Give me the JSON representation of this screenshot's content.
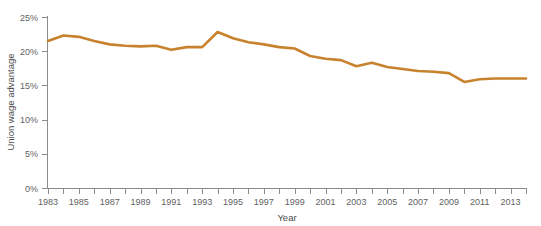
{
  "chart_data": {
    "type": "line",
    "title": "",
    "xlabel": "Year",
    "ylabel": "Union wage advantage",
    "x": [
      1983,
      1984,
      1985,
      1986,
      1987,
      1988,
      1989,
      1990,
      1991,
      1992,
      1993,
      1994,
      1995,
      1996,
      1997,
      1998,
      1999,
      2000,
      2001,
      2002,
      2003,
      2004,
      2005,
      2006,
      2007,
      2008,
      2009,
      2010,
      2011,
      2012,
      2013,
      2014
    ],
    "values": [
      21.5,
      22.3,
      22.1,
      21.5,
      21.0,
      20.8,
      20.7,
      20.8,
      20.2,
      20.6,
      20.6,
      22.8,
      21.9,
      21.3,
      21.0,
      20.6,
      20.4,
      19.3,
      18.9,
      18.7,
      17.8,
      18.3,
      17.7,
      17.4,
      17.1,
      17.0,
      16.8,
      15.5,
      15.9,
      16.0,
      16.0,
      16.0
    ],
    "series": [
      {
        "name": "Union wage advantage",
        "color": "#C8822E",
        "values": [
          21.5,
          22.3,
          22.1,
          21.5,
          21.0,
          20.8,
          20.7,
          20.8,
          20.2,
          20.6,
          20.6,
          22.8,
          21.9,
          21.3,
          21.0,
          20.6,
          20.4,
          19.3,
          18.9,
          18.7,
          17.8,
          18.3,
          17.7,
          17.4,
          17.1,
          17.0,
          16.8,
          15.5,
          15.9,
          16.0,
          16.0,
          16.0
        ]
      }
    ],
    "y_ticks": [
      0,
      5,
      10,
      15,
      20,
      25
    ],
    "y_tick_labels": [
      "0%",
      "5%",
      "10%",
      "15%",
      "20%",
      "25%"
    ],
    "ylim": [
      0,
      25
    ],
    "xlim": [
      1983,
      2014
    ],
    "x_tick_years": [
      1983,
      1984,
      1985,
      1986,
      1987,
      1988,
      1989,
      1990,
      1991,
      1992,
      1993,
      1994,
      1995,
      1996,
      1997,
      1998,
      1999,
      2000,
      2001,
      2002,
      2003,
      2004,
      2005,
      2006,
      2007,
      2008,
      2009,
      2010,
      2011,
      2012,
      2013,
      2014
    ],
    "x_tick_labels": [
      "1983",
      "1985",
      "1987",
      "1989",
      "1991",
      "1993",
      "1995",
      "1997",
      "1999",
      "2001",
      "2003",
      "2005",
      "2007",
      "2009",
      "2011",
      "2013"
    ],
    "x_label_years": [
      1983,
      1985,
      1987,
      1989,
      1991,
      1993,
      1995,
      1997,
      1999,
      2001,
      2003,
      2005,
      2007,
      2009,
      2011,
      2013
    ],
    "grid": false,
    "legend": "none",
    "line_color": "#C8822E",
    "axis_color": "#8c8c8c",
    "text_color": "#5f5f5f",
    "background": "#ffffff"
  },
  "axes": {
    "y_axis_title": "Union wage advantage",
    "x_axis_title": "Year"
  }
}
